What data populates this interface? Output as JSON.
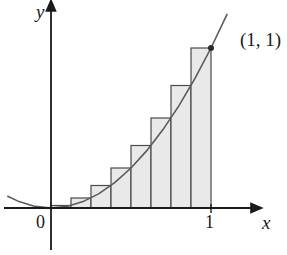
{
  "figure": {
    "kind": "riemann-sum-diagram",
    "axis_labels": {
      "x": "x",
      "y": "y"
    },
    "origin_label": "0",
    "x_tick_label": "1",
    "point_label": "(1, 1)",
    "colors": {
      "bar_fill": "#e9e9e9",
      "bar_stroke": "#4a4a4a",
      "axis": "#1a1a1a",
      "curve": "#5a5a5a",
      "text": "#1a1a1a"
    }
  },
  "chart_data": {
    "type": "bar",
    "title": "",
    "xlabel": "x",
    "ylabel": "y",
    "xlim": [
      -0.27,
      1.35
    ],
    "ylim": [
      -0.18,
      1.28
    ],
    "grid": false,
    "legend": null,
    "function": "y = x^2",
    "approximation": "right endpoint Riemann sum",
    "n_rectangles": 8,
    "delta_x": 0.125,
    "categories": [
      "0.125",
      "0.25",
      "0.375",
      "0.5",
      "0.625",
      "0.75",
      "0.875",
      "1"
    ],
    "bar_left_edges": [
      0,
      0.125,
      0.25,
      0.375,
      0.5,
      0.625,
      0.75,
      0.875
    ],
    "bar_right_edges": [
      0.125,
      0.25,
      0.375,
      0.5,
      0.625,
      0.75,
      0.875,
      1
    ],
    "values": [
      0.015625,
      0.0625,
      0.140625,
      0.25,
      0.390625,
      0.5625,
      0.765625,
      1
    ],
    "curve": {
      "name": "y = x^2",
      "x": [
        -0.27,
        -0.2,
        -0.1,
        0,
        0.1,
        0.2,
        0.3,
        0.4,
        0.5,
        0.6,
        0.7,
        0.8,
        0.9,
        1,
        1.1
      ],
      "y": [
        0.0729,
        0.04,
        0.01,
        0,
        0.01,
        0.04,
        0.09,
        0.16,
        0.25,
        0.36,
        0.49,
        0.64,
        0.81,
        1,
        1.21
      ]
    },
    "annotations": [
      {
        "label": "(1, 1)",
        "x": 1,
        "y": 1,
        "marker": "dot"
      }
    ],
    "x_ticks": [
      0,
      1
    ],
    "x_tick_labels": [
      "0",
      "1"
    ],
    "y_ticks": [],
    "y_tick_labels": []
  }
}
